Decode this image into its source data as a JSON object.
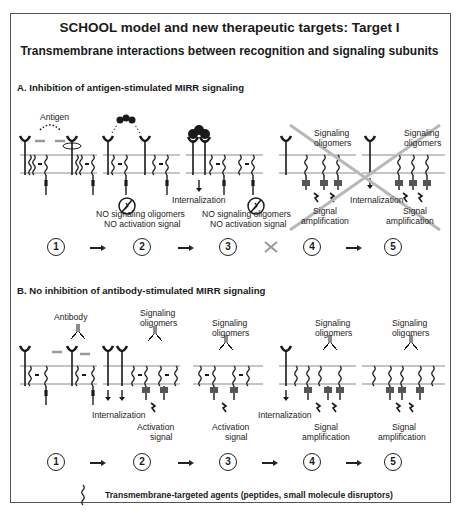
{
  "header": {
    "title": "SCHOOL model and new therapeutic targets: Target I",
    "subtitle": "Transmembrane interactions between recognition and signaling subunits"
  },
  "panel_a": {
    "heading": "A. Inhibition of antigen-stimulated MIRR signaling",
    "ligand_label": "Antigen",
    "labels": {
      "internalization_3": "Internalization",
      "no_oligomers_2": "NO signaling oligomers",
      "no_activation_2": "NO activation signal",
      "no_oligomers_3": "NO signaling oligomers",
      "no_activation_3": "NO activation signal",
      "signaling_4": "Signaling",
      "oligomers_4": "oligomers",
      "signal_4": "Signal",
      "amplification_4": "amplification",
      "signaling_5": "Signaling",
      "oligomers_5": "oligomers",
      "internalization_5": "Internalization",
      "signal_5": "Signal",
      "amplification_5": "amplification"
    },
    "steps": [
      "1",
      "2",
      "3",
      "4",
      "5"
    ],
    "blocked_transition": "3-4"
  },
  "panel_b": {
    "heading": "B. No inhibition of antibody-stimulated MIRR signaling",
    "ligand_label": "Antibody",
    "labels": {
      "signaling_2": "Signaling",
      "oligomers_2": "oligomers",
      "internalization_2": "Internalization",
      "activation_2": "Activation",
      "signal_2": "signal",
      "signaling_3": "Signaling",
      "oligomers_3": "oligomers",
      "activation_3": "Activation",
      "signal_3": "signal",
      "signaling_4": "Signaling",
      "oligomers_4": "oligomers",
      "internalization_4": "Internalization",
      "signal_4": "Signal",
      "amplification_4": "amplification",
      "signaling_5": "Signaling",
      "oligomers_5": "oligomers",
      "signal_5": "Signal",
      "amplification_5": "amplification"
    },
    "steps": [
      "1",
      "2",
      "3",
      "4",
      "5"
    ]
  },
  "legend": {
    "icon": "wavy-transmembrane-agent-icon",
    "text": "Transmembrane-targeted agents (peptides, small molecule disruptors)"
  },
  "colors": {
    "ink": "#1a1a1a",
    "membrane": "#8a8a8a",
    "shaded_arrow": "#9a9a9a",
    "cross_out": "#b8b8b8",
    "frame": "#555555"
  }
}
